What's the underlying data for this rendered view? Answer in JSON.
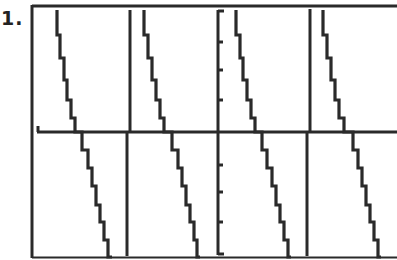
{
  "problem": {
    "label": "1."
  },
  "colors": {
    "ink": "#2a2a2a",
    "background": "#ffffff"
  },
  "chart_data": {
    "type": "line",
    "title": "",
    "xlabel": "",
    "ylabel": "",
    "grid": false,
    "legend": null,
    "axes": {
      "x_axis_pixel_y": 132,
      "y_axis_pixel_x": 218
    },
    "y_axis_ticks_pixel_y": [
      42,
      70,
      100,
      165,
      192,
      222,
      250
    ],
    "asymptotes_pixel_x": [
      128,
      309
    ],
    "series": [
      {
        "name": "branch-1",
        "points_px": [
          [
            57,
            10
          ],
          [
            60,
            35
          ],
          [
            64,
            58
          ],
          [
            67,
            80
          ],
          [
            71,
            100
          ],
          [
            75,
            118
          ],
          [
            82,
            132
          ],
          [
            88,
            150
          ],
          [
            92,
            168
          ],
          [
            96,
            186
          ],
          [
            100,
            205
          ],
          [
            104,
            222
          ],
          [
            108,
            240
          ],
          [
            112,
            257
          ]
        ]
      },
      {
        "name": "branch-2",
        "points_px": [
          [
            144,
            10
          ],
          [
            148,
            35
          ],
          [
            152,
            58
          ],
          [
            156,
            80
          ],
          [
            160,
            100
          ],
          [
            164,
            118
          ],
          [
            172,
            132
          ],
          [
            178,
            150
          ],
          [
            182,
            168
          ],
          [
            186,
            186
          ],
          [
            190,
            205
          ],
          [
            194,
            222
          ],
          [
            197,
            240
          ],
          [
            200,
            257
          ]
        ]
      },
      {
        "name": "branch-3",
        "points_px": [
          [
            236,
            10
          ],
          [
            240,
            35
          ],
          [
            243,
            58
          ],
          [
            247,
            80
          ],
          [
            251,
            100
          ],
          [
            255,
            118
          ],
          [
            262,
            132
          ],
          [
            267,
            150
          ],
          [
            272,
            168
          ],
          [
            276,
            186
          ],
          [
            280,
            205
          ],
          [
            284,
            222
          ],
          [
            288,
            240
          ],
          [
            291,
            257
          ]
        ]
      },
      {
        "name": "branch-4",
        "points_px": [
          [
            323,
            10
          ],
          [
            327,
            35
          ],
          [
            331,
            58
          ],
          [
            335,
            80
          ],
          [
            339,
            100
          ],
          [
            344,
            118
          ],
          [
            353,
            132
          ],
          [
            358,
            150
          ],
          [
            362,
            168
          ],
          [
            366,
            186
          ],
          [
            370,
            205
          ],
          [
            374,
            222
          ],
          [
            378,
            240
          ],
          [
            381,
            257
          ]
        ]
      }
    ],
    "x_intercepts_px": [
      82,
      172,
      262,
      353
    ]
  }
}
